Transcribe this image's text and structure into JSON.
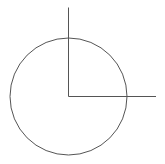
{
  "diagram": {
    "width": 165,
    "height": 164,
    "background": "#ffffff",
    "stroke_color": "#555555",
    "stroke_width": 1,
    "circle": {
      "cx": 68.5,
      "cy": 96.5,
      "r": 58.5
    },
    "vertical_line": {
      "x1": 68.5,
      "y1": 7.5,
      "x2": 68.5,
      "y2": 96.5
    },
    "horizontal_line": {
      "x1": 68.5,
      "y1": 96.5,
      "x2": 156,
      "y2": 96.5
    }
  }
}
